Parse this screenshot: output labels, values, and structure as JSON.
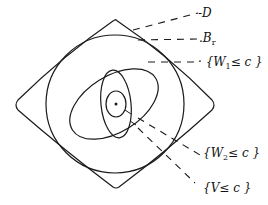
{
  "diagram": {
    "type": "nested level sets",
    "center_point": {
      "x": 116,
      "y": 104
    },
    "regions": [
      {
        "id": "D",
        "shape": "curved-diamond"
      },
      {
        "id": "B_r",
        "shape": "circle"
      },
      {
        "id": "W1",
        "shape": "tilted-ellipse"
      },
      {
        "id": "W2",
        "shape": "ellipse"
      },
      {
        "id": "V",
        "shape": "small-circle"
      }
    ],
    "labels": {
      "D": {
        "prefix": "-",
        "text": "D"
      },
      "Br": {
        "prefix": ".",
        "text": "B",
        "sub": "r"
      },
      "W1": {
        "prefix": "· {",
        "text": "W",
        "sub": "1",
        "rest": "≤ c }"
      },
      "W2": {
        "prefix": "{",
        "text": "W",
        "sub": "2",
        "rest": "≤ c }"
      },
      "V": {
        "prefix": "{",
        "text": "V",
        "rest": "≤ c }"
      }
    },
    "stroke_color": "#1a1a1a",
    "background": "#ffffff"
  }
}
